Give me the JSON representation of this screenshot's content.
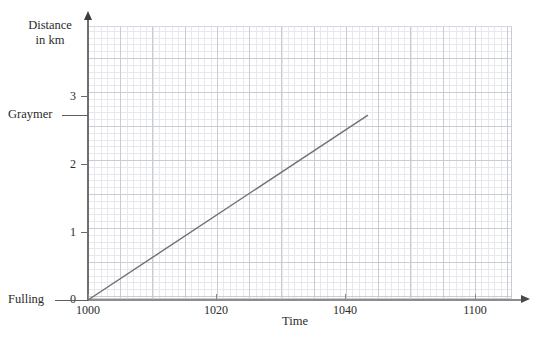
{
  "chart_data": {
    "type": "line",
    "title": "",
    "xlabel": "Time",
    "ylabel": "Distance in km",
    "ylabel_line1": "Distance",
    "ylabel_line2": "in km",
    "x": [
      1000,
      1045
    ],
    "values": [
      0,
      2.72
    ],
    "series": [
      {
        "name": "journey",
        "points": [
          {
            "x": 1000,
            "y": 0
          },
          {
            "x": 1045,
            "y": 2.72
          }
        ]
      }
    ],
    "xlim": [
      1000,
      1068
    ],
    "ylim": [
      0,
      4.03
    ],
    "x_tick_labels": [
      "1000",
      "1020",
      "1040",
      "1100"
    ],
    "x_tick_values": [
      1000,
      1020,
      1040,
      1100
    ],
    "y_tick_labels": [
      "0",
      "1",
      "2",
      "3"
    ],
    "y_tick_values": [
      0,
      1,
      2,
      3
    ],
    "grid": true,
    "grid_major_color": "#c9ccd6",
    "grid_minor_color": "#e6e8ee",
    "legend": "none",
    "line_color": "#6f6f6f",
    "annotations": [
      {
        "label": "Fulling",
        "y_value": 0,
        "type": "station-line"
      },
      {
        "label": "Graymer",
        "y_value": 2.72,
        "type": "station-line"
      }
    ]
  },
  "axes": {
    "y_title_line1": "Distance",
    "y_title_line2": "in km",
    "x_title": "Time",
    "y_ticks": [
      {
        "label": "3",
        "top": 90
      },
      {
        "label": "2",
        "top": 158
      },
      {
        "label": "1",
        "top": 226
      },
      {
        "label": "0",
        "top": 294
      }
    ],
    "x_ticks": [
      {
        "label": "1000",
        "left": 58
      },
      {
        "label": "1020",
        "left": 186
      },
      {
        "label": "1040",
        "left": 315
      },
      {
        "label": "1100",
        "left": 445
      }
    ]
  },
  "stations": [
    {
      "name": "Fulling",
      "label": "Fulling",
      "rule_top": 299,
      "rule_left": 8,
      "rule_width": 62,
      "label_left": 8,
      "label_top": 293
    },
    {
      "name": "Graymer",
      "label": "Graymer",
      "rule_top": 115,
      "rule_left": 64,
      "rule_width": 24,
      "label_left": 8,
      "label_top": 109
    }
  ],
  "artifact": {
    "top_text": ""
  }
}
